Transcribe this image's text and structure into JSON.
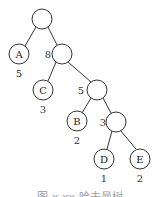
{
  "diagram": {
    "type": "huffman-tree",
    "nodes": [
      {
        "id": "root",
        "label": "",
        "weight": "",
        "cx": 42,
        "cy": 19
      },
      {
        "id": "A",
        "label": "A",
        "weight": "5",
        "cx": 19,
        "cy": 54
      },
      {
        "id": "n8",
        "label": "",
        "weight": "8",
        "cx": 62,
        "cy": 54
      },
      {
        "id": "C",
        "label": "C",
        "weight": "3",
        "cx": 43,
        "cy": 90
      },
      {
        "id": "n5",
        "label": "",
        "weight": "5",
        "cx": 97,
        "cy": 90
      },
      {
        "id": "B",
        "label": "B",
        "weight": "2",
        "cx": 77,
        "cy": 121
      },
      {
        "id": "n3",
        "label": "",
        "weight": "3",
        "cx": 116,
        "cy": 122
      },
      {
        "id": "D",
        "label": "D",
        "weight": "1",
        "cx": 104,
        "cy": 159
      },
      {
        "id": "E",
        "label": "E",
        "weight": "2",
        "cx": 140,
        "cy": 159
      }
    ],
    "edges": [
      [
        "root",
        "A"
      ],
      [
        "root",
        "n8"
      ],
      [
        "n8",
        "C"
      ],
      [
        "n8",
        "n5"
      ],
      [
        "n5",
        "B"
      ],
      [
        "n5",
        "n3"
      ],
      [
        "n3",
        "D"
      ],
      [
        "n3",
        "E"
      ]
    ],
    "caption": "图 x.xx 哈夫曼树"
  }
}
